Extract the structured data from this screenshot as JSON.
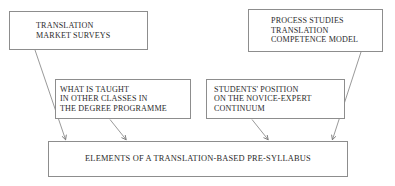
{
  "figure": {
    "title_fragment": "",
    "background_color": "#ffffff",
    "line_color": "#8d8d8d",
    "text_color": "#2b2b2b"
  },
  "nodes": {
    "translation_market_surveys": {
      "lines": [
        "TRANSLATION",
        "MARKET SURVEYS"
      ]
    },
    "process_studies": {
      "lines": [
        "PROCESS STUDIES",
        "TRANSLATION",
        "COMPETENCE MODEL"
      ]
    },
    "what_is_taught": {
      "lines": [
        "WHAT IS TAUGHT",
        "IN OTHER CLASSES IN",
        "THE DEGREE PROGRAMME"
      ]
    },
    "students_position": {
      "lines": [
        "STUDENTS' POSITION",
        "ON THE NOVICE-EXPERT",
        "CONTINUUM"
      ]
    },
    "pre_syllabus": {
      "lines": [
        "ELEMENTS OF A TRANSLATION-BASED PRE-SYLLABUS"
      ]
    }
  },
  "connectors": [
    {
      "from": "translation_market_surveys",
      "to": "pre_syllabus",
      "arrow": true
    },
    {
      "from": "what_is_taught",
      "to": "pre_syllabus",
      "arrow": true
    },
    {
      "from": "students_position",
      "to": "pre_syllabus",
      "arrow": true
    },
    {
      "from": "process_studies",
      "to": "pre_syllabus",
      "arrow": true
    }
  ]
}
